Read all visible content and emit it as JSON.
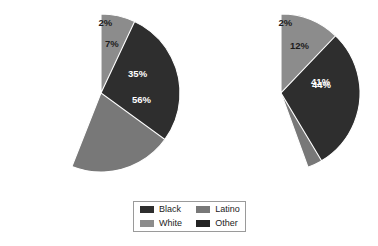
{
  "chart_data": [
    {
      "type": "pie",
      "title": "",
      "name": "pie-chart-left",
      "categories": [
        "Other",
        "Latino",
        "Black",
        "White"
      ],
      "values": [
        2,
        56,
        35,
        7
      ],
      "labels": [
        "2%",
        "56%",
        "35%",
        "7%"
      ],
      "start_angle_deg": 0,
      "direction": "clockwise",
      "center": [
        101,
        93
      ],
      "radius": 79,
      "legend": "shared"
    },
    {
      "type": "pie",
      "title": "",
      "name": "pie-chart-right",
      "categories": [
        "Other",
        "Latino",
        "Black",
        "White"
      ],
      "values": [
        2,
        44,
        41,
        12
      ],
      "labels": [
        "2%",
        "44%",
        "41%",
        "12%"
      ],
      "start_angle_deg": 0,
      "direction": "clockwise",
      "center": [
        281,
        93
      ],
      "radius": 79,
      "legend": "shared"
    }
  ],
  "legend": {
    "entries": [
      {
        "label": "Black",
        "color": "#2e2e2e"
      },
      {
        "label": "Latino",
        "color": "#787878"
      },
      {
        "label": "White",
        "color": "#8c8c8c"
      },
      {
        "label": "Other",
        "color": "#232323"
      }
    ]
  },
  "colors": {
    "black": "#2e2e2e",
    "white": "#8c8c8c",
    "latino": "#787878",
    "other": "#232323",
    "slice_outline": "#ffffff",
    "label_light": "#ffffff",
    "label_dark": "#1c1c1c",
    "legend_border": "#9a9a9a",
    "background": "#ffffff"
  }
}
